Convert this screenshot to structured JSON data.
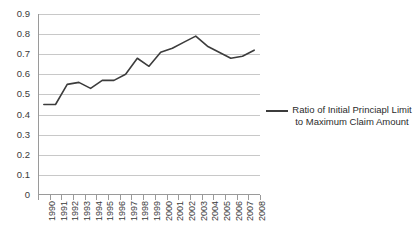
{
  "chart_data": {
    "type": "line",
    "title": "",
    "xlabel": "",
    "ylabel": "",
    "ylim": [
      0,
      0.9
    ],
    "grid": true,
    "legend_position": "right",
    "y_ticks": [
      "0",
      "0.1",
      "0.2",
      "0.3",
      "0.4",
      "0.5",
      "0.6",
      "0.7",
      "0.8",
      "0.9"
    ],
    "y_tick_values": [
      0,
      0.1,
      0.2,
      0.3,
      0.4,
      0.5,
      0.6,
      0.7,
      0.8,
      0.9
    ],
    "categories": [
      "1990",
      "1991",
      "1992",
      "1993",
      "1994",
      "1995",
      "1996",
      "1997",
      "1998",
      "1999",
      "2000",
      "2001",
      "2002",
      "2003",
      "2004",
      "2005",
      "2006",
      "2007",
      "2008"
    ],
    "series": [
      {
        "name": "Ratio of Initial Princiapl Limit to Maximum Claim Amount",
        "color": "#3c3c3c",
        "values": [
          0.45,
          0.45,
          0.55,
          0.56,
          0.53,
          0.57,
          0.57,
          0.6,
          0.68,
          0.64,
          0.71,
          0.73,
          0.76,
          0.79,
          0.74,
          0.71,
          0.68,
          0.69,
          0.72
        ]
      }
    ]
  },
  "legend": {
    "entries": [
      {
        "line1": "Ratio of Initial Princiapl Limit",
        "line2": "to Maximum Claim Amount"
      }
    ]
  },
  "colors": {
    "series": "#3c3c3c",
    "gridline": "#c8c8c8",
    "axis": "#9a9a9a",
    "background": "#ffffff"
  }
}
